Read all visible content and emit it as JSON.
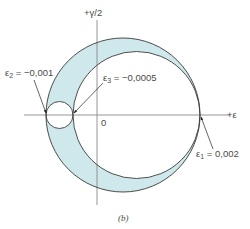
{
  "figure": {
    "caption": "(b)",
    "axes": {
      "horizontal_label": "+ε",
      "vertical_label": "+γ/2",
      "origin_label": "0"
    },
    "annotations": [
      {
        "symbol": "ε",
        "subscript": "1",
        "text": " = 0,002"
      },
      {
        "symbol": "ε",
        "subscript": "2",
        "text": " = −0,001"
      },
      {
        "symbol": "ε",
        "subscript": "3",
        "text": " = −0,0005"
      }
    ],
    "colors": {
      "fill": "#cfe8ec",
      "stroke": "#3a3a3a",
      "axis": "#8a8a8a",
      "text": "#4a4a4a"
    }
  }
}
